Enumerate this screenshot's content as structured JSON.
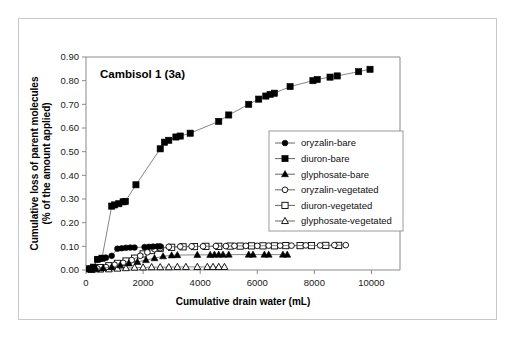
{
  "chart_data": {
    "type": "scatter",
    "title": "Cambisol 1 (3a)",
    "xlabel": "Cumulative drain water (mL)",
    "ylabel": "Cumulative loss of parent molecules\n(% of the amount applied)",
    "ylabel_line1": "Cumulative loss of parent molecules",
    "ylabel_line2": "(% of the amount applied)",
    "xlim": [
      0,
      11000
    ],
    "ylim": [
      0.0,
      0.9
    ],
    "xticks": [
      0,
      2000,
      4000,
      6000,
      8000,
      10000
    ],
    "xtick_labels": [
      "0",
      "2000",
      "4000",
      "6000",
      "8000",
      "10000"
    ],
    "yticks": [
      0.0,
      0.1,
      0.2,
      0.3,
      0.4,
      0.5,
      0.6,
      0.7,
      0.8,
      0.9
    ],
    "ytick_labels": [
      "0.00",
      "0.10",
      "0.20",
      "0.30",
      "0.40",
      "0.50",
      "0.60",
      "0.70",
      "0.80",
      "0.90"
    ],
    "grid": false,
    "legend_position": "center-right",
    "series": [
      {
        "name": "oryzalin-bare",
        "marker": "filled-circle",
        "color": "#000000",
        "points": [
          [
            120,
            0.004
          ],
          [
            260,
            0.01
          ],
          [
            400,
            0.045
          ],
          [
            520,
            0.048
          ],
          [
            700,
            0.052
          ],
          [
            900,
            0.06
          ],
          [
            1100,
            0.09
          ],
          [
            1250,
            0.092
          ],
          [
            1400,
            0.094
          ],
          [
            1550,
            0.095
          ],
          [
            1700,
            0.095
          ],
          [
            2050,
            0.097
          ],
          [
            2200,
            0.098
          ],
          [
            2350,
            0.099
          ],
          [
            2500,
            0.1
          ],
          [
            2600,
            0.1
          ]
        ]
      },
      {
        "name": "diuron-bare",
        "marker": "filled-square",
        "color": "#000000",
        "points": [
          [
            120,
            0.005
          ],
          [
            260,
            0.012
          ],
          [
            400,
            0.045
          ],
          [
            560,
            0.05
          ],
          [
            900,
            0.27
          ],
          [
            1000,
            0.275
          ],
          [
            1150,
            0.28
          ],
          [
            1300,
            0.288
          ],
          [
            1380,
            0.29
          ],
          [
            1750,
            0.36
          ],
          [
            2600,
            0.512
          ],
          [
            2750,
            0.54
          ],
          [
            2900,
            0.548
          ],
          [
            3150,
            0.562
          ],
          [
            3300,
            0.566
          ],
          [
            3650,
            0.578
          ],
          [
            4650,
            0.628
          ],
          [
            5000,
            0.655
          ],
          [
            5700,
            0.7
          ],
          [
            6050,
            0.722
          ],
          [
            6300,
            0.735
          ],
          [
            6450,
            0.742
          ],
          [
            6600,
            0.747
          ],
          [
            7150,
            0.775
          ],
          [
            7950,
            0.8
          ],
          [
            8100,
            0.805
          ],
          [
            8550,
            0.815
          ],
          [
            8800,
            0.82
          ],
          [
            9550,
            0.838
          ],
          [
            9950,
            0.848
          ]
        ]
      },
      {
        "name": "glyphosate-bare",
        "marker": "filled-triangle",
        "color": "#000000",
        "points": [
          [
            150,
            0.002
          ],
          [
            350,
            0.004
          ],
          [
            600,
            0.008
          ],
          [
            900,
            0.012
          ],
          [
            1200,
            0.02
          ],
          [
            1500,
            0.028
          ],
          [
            1800,
            0.034
          ],
          [
            2100,
            0.042
          ],
          [
            2400,
            0.05
          ],
          [
            2700,
            0.058
          ],
          [
            3000,
            0.062
          ],
          [
            3200,
            0.063
          ],
          [
            3900,
            0.064
          ],
          [
            4350,
            0.064
          ],
          [
            4500,
            0.065
          ],
          [
            4650,
            0.065
          ],
          [
            4800,
            0.065
          ],
          [
            5000,
            0.065
          ],
          [
            5700,
            0.065
          ],
          [
            5850,
            0.065
          ],
          [
            6250,
            0.065
          ],
          [
            6400,
            0.065
          ],
          [
            6900,
            0.065
          ],
          [
            7050,
            0.065
          ]
        ]
      },
      {
        "name": "oryzalin-vegetated",
        "marker": "open-circle",
        "color": "#000000",
        "points": [
          [
            150,
            0.002
          ],
          [
            400,
            0.006
          ],
          [
            700,
            0.012
          ],
          [
            1000,
            0.022
          ],
          [
            1300,
            0.03
          ],
          [
            1600,
            0.042
          ],
          [
            1900,
            0.06
          ],
          [
            2150,
            0.075
          ],
          [
            2400,
            0.088
          ],
          [
            2600,
            0.092
          ],
          [
            2900,
            0.098
          ],
          [
            3300,
            0.099
          ],
          [
            3700,
            0.1
          ],
          [
            4100,
            0.1
          ],
          [
            4550,
            0.101
          ],
          [
            4900,
            0.101
          ],
          [
            5200,
            0.102
          ],
          [
            5600,
            0.102
          ],
          [
            6000,
            0.102
          ],
          [
            6400,
            0.103
          ],
          [
            6800,
            0.103
          ],
          [
            7200,
            0.103
          ],
          [
            7700,
            0.104
          ],
          [
            8200,
            0.104
          ],
          [
            8700,
            0.105
          ],
          [
            9100,
            0.105
          ]
        ]
      },
      {
        "name": "diuron-vegetated",
        "marker": "open-square",
        "color": "#000000",
        "points": [
          [
            200,
            0.004
          ],
          [
            500,
            0.01
          ],
          [
            800,
            0.018
          ],
          [
            1100,
            0.028
          ],
          [
            1400,
            0.038
          ],
          [
            1700,
            0.05
          ],
          [
            2000,
            0.068
          ],
          [
            2300,
            0.082
          ],
          [
            2600,
            0.092
          ],
          [
            3000,
            0.096
          ],
          [
            3400,
            0.098
          ],
          [
            3800,
            0.099
          ],
          [
            4200,
            0.1
          ],
          [
            4650,
            0.1
          ],
          [
            5050,
            0.101
          ],
          [
            5400,
            0.101
          ],
          [
            5800,
            0.102
          ],
          [
            6200,
            0.102
          ],
          [
            6600,
            0.102
          ],
          [
            7000,
            0.103
          ],
          [
            7500,
            0.103
          ],
          [
            7900,
            0.103
          ],
          [
            8400,
            0.104
          ],
          [
            8850,
            0.104
          ]
        ]
      },
      {
        "name": "glyphosate-vegetated",
        "marker": "open-triangle",
        "color": "#000000",
        "points": [
          [
            200,
            0.001
          ],
          [
            500,
            0.002
          ],
          [
            800,
            0.003
          ],
          [
            1100,
            0.006
          ],
          [
            1400,
            0.008
          ],
          [
            1700,
            0.01
          ],
          [
            2000,
            0.011
          ],
          [
            2300,
            0.012
          ],
          [
            2600,
            0.012
          ],
          [
            2900,
            0.012
          ],
          [
            3200,
            0.013
          ],
          [
            3500,
            0.013
          ],
          [
            3900,
            0.013
          ],
          [
            4250,
            0.013
          ],
          [
            4450,
            0.013
          ],
          [
            4650,
            0.013
          ],
          [
            4850,
            0.013
          ]
        ]
      }
    ]
  }
}
